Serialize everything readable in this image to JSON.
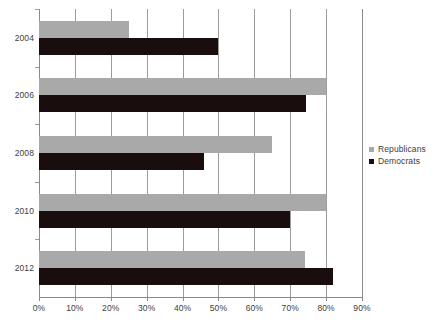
{
  "chart_data": {
    "type": "bar",
    "orientation": "horizontal",
    "title": "",
    "subtitle": "",
    "xlabel": "",
    "ylabel": "",
    "xlim": [
      0,
      90
    ],
    "grid": true,
    "legend_position": "right",
    "categories": [
      "2004",
      "2006",
      "2008",
      "2010",
      "2012"
    ],
    "xticks": [
      0,
      10,
      20,
      30,
      40,
      50,
      60,
      70,
      80,
      90
    ],
    "xticklabels": [
      "0%",
      "10%",
      "20%",
      "30%",
      "40%",
      "50%",
      "60%",
      "70%",
      "80%",
      "90%"
    ],
    "series": [
      {
        "name": "Republicans",
        "color": "#a9a9a9",
        "values": [
          25,
          80,
          65,
          80,
          74
        ]
      },
      {
        "name": "Democrats",
        "color": "#190d0d",
        "values": [
          50,
          74.5,
          46,
          70,
          82
        ]
      }
    ]
  },
  "legend": {
    "items": [
      {
        "label": "Republicans",
        "color": "#a9a9a9"
      },
      {
        "label": "Democrats",
        "color": "#190d0d"
      }
    ]
  },
  "axis": {
    "gridline_color": "#9b9b9b",
    "axis_color": "#8a8a8a",
    "tick_text_color": "#3d3d3d"
  }
}
